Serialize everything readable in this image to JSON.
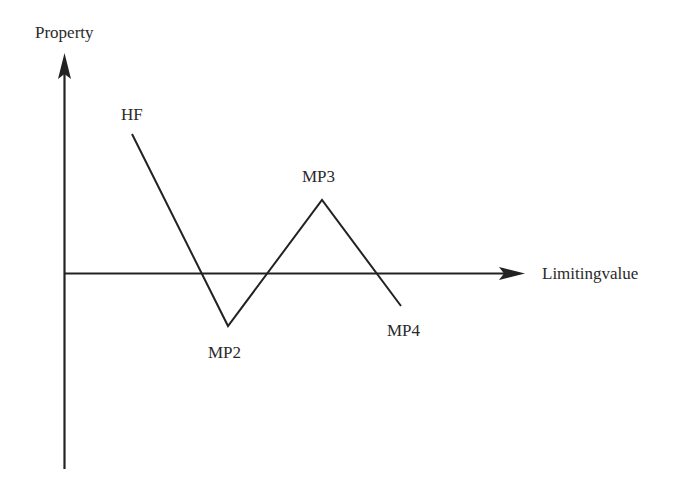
{
  "diagram": {
    "axes": {
      "y_label": "Property",
      "x_label": "Limitingvalue",
      "origin": [
        64,
        274
      ],
      "y_axis_top": 53,
      "y_axis_bottom": 469,
      "x_axis_right": 525
    },
    "points": [
      {
        "id": "HF",
        "label": "HF",
        "x": 132,
        "y": 134
      },
      {
        "id": "MP2",
        "label": "MP2",
        "x": 228,
        "y": 326
      },
      {
        "id": "MP3",
        "label": "MP3",
        "x": 322,
        "y": 200
      },
      {
        "id": "MP4",
        "label": "MP4",
        "x": 401,
        "y": 306
      }
    ],
    "colors": {
      "line": "#222222",
      "text": "#2a2a2a",
      "background": "#ffffff"
    }
  },
  "labels": {
    "y_axis": "Property",
    "x_axis": "Limitingvalue",
    "hf": "HF",
    "mp2": "MP2",
    "mp3": "MP3",
    "mp4": "MP4"
  }
}
